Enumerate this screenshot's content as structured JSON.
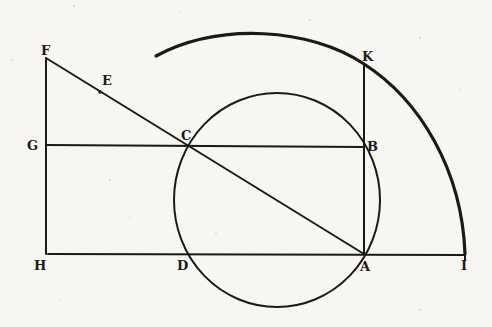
{
  "figure": {
    "points": {
      "F": "F",
      "E": "E",
      "G": "G",
      "C": "C",
      "K": "K",
      "B": "B",
      "H": "H",
      "D": "D",
      "A": "A",
      "I": "I"
    },
    "colors": {
      "ink": "#1a1a1a",
      "paper": "#f7f6f2"
    }
  }
}
